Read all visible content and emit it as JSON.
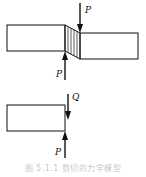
{
  "figure": {
    "top": {
      "force_top_label": "P",
      "force_bottom_label": "P"
    },
    "bottom": {
      "force_top_label": "Q",
      "force_bottom_label": "P"
    },
    "caption": "图 5.1.1   剪切的力学模型"
  },
  "colors": {
    "stroke": "#111111",
    "caption": "#c8c8c8"
  }
}
